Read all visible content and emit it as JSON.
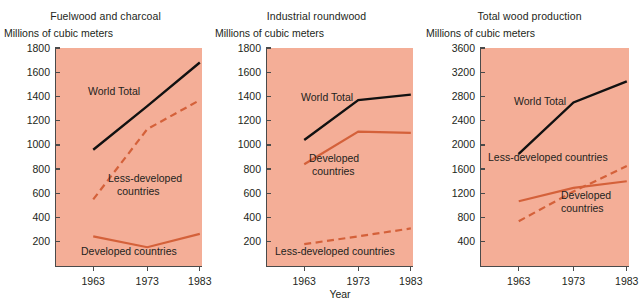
{
  "figure": {
    "background_color": "#ffffff",
    "plot_background_color": "#f4ae97",
    "world_total_color": "#111111",
    "regional_color": "#d4613a",
    "axis_color": "#4a4a4a",
    "xaxis_title": "Year",
    "width": 637,
    "height": 305
  },
  "chart_data": [
    {
      "type": "line",
      "title": "Fuelwood and charcoal",
      "ylabel": "Millions of cubic meters",
      "xlabel": "Year",
      "x": [
        1963,
        1973,
        1983
      ],
      "xticklabels": [
        "1963",
        "1973",
        "1983"
      ],
      "ylim": [
        0,
        1800
      ],
      "yticks": [
        200,
        400,
        600,
        800,
        1000,
        1200,
        1400,
        1600,
        1800
      ],
      "yticklabels": [
        "200",
        "400",
        "600",
        "800",
        "1000",
        "1200",
        "1400",
        "1600",
        "1800"
      ],
      "grid": false,
      "legend_position": "inline-annotations",
      "series": [
        {
          "name": "World Total",
          "values": [
            960,
            1320,
            1680
          ],
          "style": "solid",
          "color": "#111111"
        },
        {
          "name": "Less-developed countries",
          "values": [
            550,
            1130,
            1370
          ],
          "style": "dashed",
          "color": "#d4613a"
        },
        {
          "name": "Developed countries",
          "values": [
            245,
            155,
            265
          ],
          "style": "solid",
          "color": "#d4613a"
        }
      ],
      "annotations": [
        {
          "text": "World Total",
          "series": "World Total"
        },
        {
          "text": "Less-developed\ncountries",
          "series": "Less-developed countries"
        },
        {
          "text": "Developed countries",
          "series": "Developed countries"
        }
      ]
    },
    {
      "type": "line",
      "title": "Industrial roundwood",
      "ylabel": "Millions of cubic meters",
      "xlabel": "Year",
      "x": [
        1963,
        1973,
        1983
      ],
      "xticklabels": [
        "1963",
        "1973",
        "1983"
      ],
      "ylim": [
        0,
        1800
      ],
      "yticks": [
        200,
        400,
        600,
        800,
        1000,
        1200,
        1400,
        1600,
        1800
      ],
      "yticklabels": [
        "200",
        "400",
        "600",
        "800",
        "1000",
        "1200",
        "1400",
        "1600",
        "1800"
      ],
      "grid": false,
      "legend_position": "inline-annotations",
      "series": [
        {
          "name": "World Total",
          "values": [
            1040,
            1370,
            1415
          ],
          "style": "solid",
          "color": "#111111"
        },
        {
          "name": "Developed countries",
          "values": [
            840,
            1110,
            1100
          ],
          "style": "solid",
          "color": "#d4613a"
        },
        {
          "name": "Less-developed countries",
          "values": [
            180,
            245,
            310
          ],
          "style": "dashed",
          "color": "#d4613a"
        }
      ],
      "annotations": [
        {
          "text": "World Total",
          "series": "World Total"
        },
        {
          "text": "Developed\ncountries",
          "series": "Developed countries"
        },
        {
          "text": "Less-developed countries",
          "series": "Less-developed countries"
        }
      ]
    },
    {
      "type": "line",
      "title": "Total wood production",
      "ylabel": "Millions of cubic meters",
      "xlabel": "Year",
      "x": [
        1963,
        1973,
        1983
      ],
      "xticklabels": [
        "1963",
        "1973",
        "1983"
      ],
      "ylim": [
        0,
        3600
      ],
      "yticks": [
        400,
        800,
        1200,
        1600,
        2000,
        2400,
        2800,
        3200,
        3600
      ],
      "yticklabels": [
        "400",
        "800",
        "1200",
        "1600",
        "2000",
        "2400",
        "2800",
        "3200",
        "3600"
      ],
      "grid": false,
      "legend_position": "inline-annotations",
      "series": [
        {
          "name": "World Total",
          "values": [
            1850,
            2700,
            3050
          ],
          "style": "solid",
          "color": "#111111"
        },
        {
          "name": "Less-developed countries",
          "values": [
            740,
            1230,
            1650
          ],
          "style": "dashed",
          "color": "#d4613a"
        },
        {
          "name": "Developed countries",
          "values": [
            1070,
            1290,
            1400
          ],
          "style": "solid",
          "color": "#d4613a"
        }
      ],
      "annotations": [
        {
          "text": "World Total",
          "series": "World Total"
        },
        {
          "text": "Less-developed countries",
          "series": "Less-developed countries"
        },
        {
          "text": "Developed\ncountries",
          "series": "Developed countries"
        }
      ]
    }
  ],
  "panels": [
    {
      "title": "Fuelwood and charcoal",
      "unit_label": "Millions of cubic meters",
      "annotations": {
        "world_total": "World Total",
        "less_developed_line1": "Less-developed",
        "less_developed_line2": "countries",
        "developed": "Developed countries"
      }
    },
    {
      "title": "Industrial roundwood",
      "unit_label": "Millions of cubic meters",
      "annotations": {
        "world_total": "World Total",
        "developed_line1": "Developed",
        "developed_line2": "countries",
        "less_developed": "Less-developed countries"
      }
    },
    {
      "title": "Total wood production",
      "unit_label": "Millions of cubic meters",
      "annotations": {
        "world_total": "World Total",
        "less_developed": "Less-developed countries",
        "developed_line1": "Developed",
        "developed_line2": "countries"
      }
    }
  ]
}
